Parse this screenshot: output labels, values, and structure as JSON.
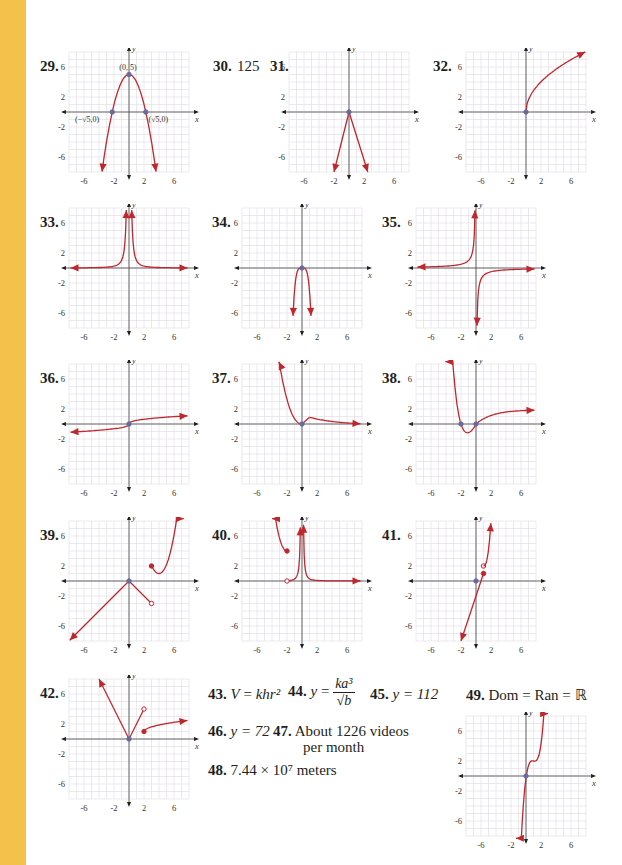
{
  "page": {
    "accent_strip_color": "#f4c24a",
    "curve_color": "#c0272d",
    "axis_color": "#231f20",
    "grid_color": "#e4e0e6"
  },
  "graph_axes": {
    "x_label": "x",
    "y_label": "y",
    "x_ticks": [
      "-6",
      "-2",
      "2",
      "6"
    ],
    "y_ticks": [
      "6",
      "2",
      "-2",
      "-6"
    ],
    "range": [
      -8,
      8
    ]
  },
  "answers": {
    "a29": {
      "num": "29.",
      "annotations": [
        "(0, 5)",
        "(−√5,0)",
        "(√5,0)"
      ]
    },
    "a30": {
      "num": "30.",
      "text": "125"
    },
    "a31": {
      "num": "31."
    },
    "a32": {
      "num": "32."
    },
    "a33": {
      "num": "33."
    },
    "a34": {
      "num": "34."
    },
    "a35": {
      "num": "35."
    },
    "a36": {
      "num": "36."
    },
    "a37": {
      "num": "37."
    },
    "a38": {
      "num": "38."
    },
    "a39": {
      "num": "39."
    },
    "a40": {
      "num": "40."
    },
    "a41": {
      "num": "41."
    },
    "a42": {
      "num": "42."
    },
    "a43": {
      "num": "43.",
      "lhs": "V",
      "rhs": "khr²"
    },
    "a44": {
      "num": "44.",
      "lhs": "y",
      "numerator": "ka³",
      "denominator": "√b"
    },
    "a45": {
      "num": "45.",
      "text": "y = 112"
    },
    "a46": {
      "num": "46.",
      "text": "y = 72"
    },
    "a47": {
      "num": "47.",
      "line1": "About 1226 videos",
      "line2": "per month"
    },
    "a48": {
      "num": "48.",
      "text": "7.44 × 10⁷ meters"
    },
    "a49": {
      "num": "49.",
      "text": "Dom = Ran = ℝ"
    }
  },
  "chart_data": [
    {
      "id": "29",
      "type": "line",
      "title": "29.",
      "xlabel": "x",
      "ylabel": "y",
      "xlim": [
        -8,
        8
      ],
      "ylim": [
        -8,
        8
      ],
      "grid": true,
      "description": "downward parabola y = 5 - x^2",
      "key_points": [
        [
          0,
          5
        ],
        [
          -2.236,
          0
        ],
        [
          2.236,
          0
        ]
      ],
      "annotations": [
        "(0, 5)",
        "(−√5,0)",
        "(√5,0)"
      ]
    },
    {
      "id": "31",
      "type": "line",
      "title": "31.",
      "xlim": [
        -8,
        8
      ],
      "ylim": [
        -8,
        8
      ],
      "grid": true,
      "description": "inverted V from origin down to (-2,-8) and (2.5,-8)",
      "key_points": [
        [
          0,
          0
        ],
        [
          -2,
          -8
        ],
        [
          2.5,
          -8
        ]
      ]
    },
    {
      "id": "32",
      "type": "line",
      "title": "32.",
      "xlim": [
        -8,
        8
      ],
      "ylim": [
        -8,
        8
      ],
      "grid": true,
      "description": "increasing concave curve from origin, sqrt-like",
      "key_points": [
        [
          0,
          0
        ],
        [
          8,
          8
        ]
      ]
    },
    {
      "id": "33",
      "type": "line",
      "title": "33.",
      "xlim": [
        -8,
        8
      ],
      "ylim": [
        -8,
        8
      ],
      "grid": true,
      "description": "y = 1/x^2 style, vertical asymptote x=0, horizontal asymptote y=0"
    },
    {
      "id": "34",
      "type": "line",
      "title": "34.",
      "xlim": [
        -8,
        8
      ],
      "ylim": [
        -8,
        8
      ],
      "grid": true,
      "description": "narrow downward curve from origin to (-1.5,-8) and (1.5,-8)",
      "key_points": [
        [
          0,
          0
        ]
      ]
    },
    {
      "id": "35",
      "type": "line",
      "title": "35.",
      "xlim": [
        -8,
        8
      ],
      "ylim": [
        -8,
        8
      ],
      "grid": true,
      "description": "y = -1/x style hyperbola",
      "key_points": []
    },
    {
      "id": "36",
      "type": "line",
      "title": "36.",
      "xlim": [
        -8,
        8
      ],
      "ylim": [
        -8,
        8
      ],
      "grid": true,
      "description": "cube-root-like increasing S curve through origin, from (-8,-1) to (8,1)",
      "key_points": [
        [
          0,
          0
        ]
      ]
    },
    {
      "id": "37",
      "type": "line",
      "title": "37.",
      "xlim": [
        -8,
        8
      ],
      "ylim": [
        -8,
        8
      ],
      "grid": true,
      "description": "decreasing curve from (-3,8) to (0,0), then from (1,1) decaying to (8,0)",
      "key_points": [
        [
          0,
          0
        ],
        [
          1,
          1
        ]
      ]
    },
    {
      "id": "38",
      "type": "line",
      "title": "38.",
      "xlim": [
        -8,
        8
      ],
      "ylim": [
        -8,
        8
      ],
      "grid": true,
      "description": "curve from (-4,8) down through (-2,0) min near (-1,-1), through origin, increasing to (8,2)",
      "key_points": [
        [
          -2,
          0
        ],
        [
          0,
          0
        ]
      ]
    },
    {
      "id": "39",
      "type": "line",
      "title": "39.",
      "xlim": [
        -8,
        8
      ],
      "ylim": [
        -8,
        8
      ],
      "grid": true,
      "description": "piecewise: line y=x for x<=0; line y=-x for 0<x<3 open at (3,-3); curve from (3,2) closed, min near (4,1), rising to (8,8)",
      "key_points": [
        [
          0,
          0
        ],
        [
          3,
          -3
        ],
        [
          3,
          2
        ]
      ]
    },
    {
      "id": "40",
      "type": "line",
      "title": "40.",
      "xlim": [
        -8,
        8
      ],
      "ylim": [
        -8,
        8
      ],
      "grid": true,
      "description": "piecewise: curve from (-4,8) down to (-2,4) closed; from (-2,0) open rising to vertical asymptote x=0; right branch decaying to y=0",
      "key_points": [
        [
          -2,
          4
        ],
        [
          -2,
          0
        ]
      ]
    },
    {
      "id": "41",
      "type": "line",
      "title": "41.",
      "xlim": [
        -8,
        8
      ],
      "ylim": [
        -8,
        8
      ],
      "grid": true,
      "description": "increasing line from (-2,-8) through origin to (1,1) closed, open at (1,2), then steep curve to (2,8)",
      "key_points": [
        [
          0,
          0
        ],
        [
          1,
          1
        ],
        [
          1,
          2
        ]
      ]
    },
    {
      "id": "42",
      "type": "line",
      "title": "42.",
      "xlim": [
        -8,
        8
      ],
      "ylim": [
        -8,
        8
      ],
      "grid": true,
      "description": "piecewise: line from (-4,8) to origin; line from origin to (2,4) open; curve from (2,1) closed rising to (8,2.5)",
      "key_points": [
        [
          0,
          0
        ],
        [
          2,
          4
        ],
        [
          2,
          1
        ]
      ]
    },
    {
      "id": "49",
      "type": "line",
      "title": "49.",
      "xlim": [
        -8,
        8
      ],
      "ylim": [
        -8,
        8
      ],
      "grid": true,
      "description": "cubic-like increasing curve from (-1.5,-8) through (0,0), plateau near (1,2), to (3,8)",
      "key_points": [
        [
          0,
          0
        ]
      ]
    }
  ]
}
